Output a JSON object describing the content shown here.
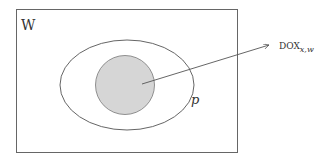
{
  "diagram": {
    "world_label": "W",
    "set_label": "p",
    "arrow_target_label": "DOX",
    "arrow_target_subscript": "x,w",
    "colors": {
      "stroke": "#555555",
      "inner_fill": "#d6d6d6",
      "background": "#ffffff"
    }
  }
}
